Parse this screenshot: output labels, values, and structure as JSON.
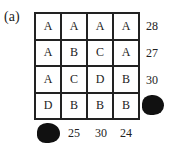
{
  "label": "(a)",
  "grid": [
    [
      "A",
      "A",
      "A",
      "A"
    ],
    [
      "A",
      "B",
      "C",
      "A"
    ],
    [
      "A",
      "C",
      "D",
      "B"
    ],
    [
      "D",
      "B",
      "B",
      "B"
    ]
  ],
  "row_sums": [
    "28",
    "27",
    "30",
    ""
  ],
  "col_sums": [
    "",
    "25",
    "30",
    "24"
  ],
  "hidden": [
    "row_sum_4",
    "col_sum_1"
  ]
}
